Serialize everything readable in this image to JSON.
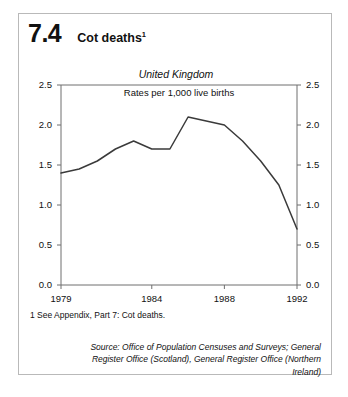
{
  "figure": {
    "number": "7.4",
    "title": "Cot deaths",
    "title_superscript": "1"
  },
  "footnote": "1  See Appendix, Part 7: Cot deaths.",
  "source": "Source: Office of Population Censuses and Surveys; General Register Office (Scotland), General Register Office (Northern Ireland)",
  "colors": {
    "line": "#3a3a3a",
    "axis": "#6f6f6f",
    "panel_border": "#b9b9b9",
    "text": "#111111",
    "background": "#ffffff"
  },
  "chart_data": {
    "type": "line",
    "title": "Cot deaths",
    "subtitle": "United Kingdom",
    "annotation": "Rates per 1,000 live births",
    "xlabel": "",
    "ylabel": "",
    "x": [
      1979,
      1980,
      1981,
      1982,
      1983,
      1984,
      1985,
      1986,
      1987,
      1988,
      1989,
      1990,
      1991,
      1992
    ],
    "values": [
      1.4,
      1.45,
      1.55,
      1.7,
      1.8,
      1.7,
      1.7,
      2.1,
      2.05,
      2.0,
      1.8,
      1.55,
      1.25,
      0.7
    ],
    "series": [
      {
        "name": "United Kingdom",
        "values": [
          1.4,
          1.45,
          1.55,
          1.7,
          1.8,
          1.7,
          1.7,
          2.1,
          2.05,
          2.0,
          1.8,
          1.55,
          1.25,
          0.7
        ]
      }
    ],
    "xlim": [
      1979,
      1992
    ],
    "ylim": [
      0.0,
      2.5
    ],
    "yticks": [
      0.0,
      0.5,
      1.0,
      1.5,
      2.0,
      2.5
    ],
    "ytick_labels": [
      "0.0",
      "0.5",
      "1.0",
      "1.5",
      "2.0",
      "2.5"
    ],
    "xticks": [
      1979,
      1984,
      1988,
      1992
    ],
    "xtick_labels": [
      "1979",
      "1984",
      "1988",
      "1992"
    ],
    "grid": false,
    "legend": false,
    "dual_y_axis": true
  }
}
